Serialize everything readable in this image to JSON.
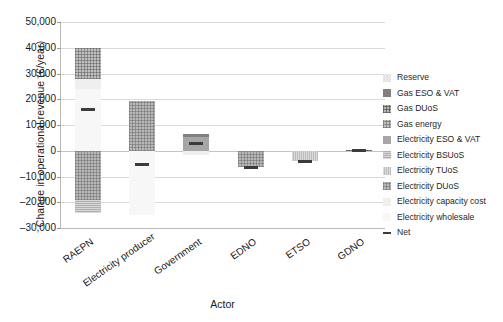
{
  "chart_data": {
    "type": "bar",
    "subtype": "stacked-bar-with-net-marker",
    "title": "",
    "xlabel": "Actor",
    "ylabel": "Change in operational revenue (€/year)",
    "ylim": [
      -30000,
      50000
    ],
    "ytick_step": 10000,
    "yticks": [
      50000,
      40000,
      30000,
      20000,
      10000,
      0,
      -10000,
      -20000,
      -30000
    ],
    "ytick_labels": [
      "50,000",
      "40,000",
      "30,000",
      "20,000",
      "10,000",
      "0",
      "–10,000",
      "–20,000",
      "–30,000"
    ],
    "grid": true,
    "legend_position": "right",
    "categories": [
      "RAEPN",
      "Electricity producer",
      "Government",
      "EDNO",
      "ETSO",
      "GDNO"
    ],
    "series": [
      {
        "name": "Reserve",
        "key": "reserve",
        "values": [
          0,
          0,
          0,
          0,
          0,
          0
        ]
      },
      {
        "name": "Gas ESO & VAT",
        "key": "gasesovat",
        "values": [
          0,
          0,
          1200,
          0,
          0,
          0
        ]
      },
      {
        "name": "Gas DUoS",
        "key": "gasduos",
        "values": [
          0,
          0,
          0,
          0,
          0,
          300
        ]
      },
      {
        "name": "Gas energy",
        "key": "gasenergy",
        "values": [
          12000,
          0,
          0,
          0,
          0,
          0
        ]
      },
      {
        "name": "Electricity ESO & VAT",
        "key": "elecesovat",
        "values": [
          0,
          0,
          5300,
          0,
          0,
          0
        ]
      },
      {
        "name": "Electricity BSUoS",
        "key": "elecbsuos",
        "values": [
          -5200,
          0,
          0,
          0,
          0,
          0
        ]
      },
      {
        "name": "Electricity TUoS",
        "key": "electuos",
        "values": [
          0,
          0,
          0,
          0,
          -4000,
          0
        ]
      },
      {
        "name": "Electricity DUoS",
        "key": "elecduos",
        "values": [
          -19000,
          19500,
          0,
          -6500,
          0,
          0
        ]
      },
      {
        "name": "Electricity capacity cost",
        "key": "eleccap",
        "values": [
          4000,
          0,
          -1500,
          0,
          0,
          0
        ]
      },
      {
        "name": "Electricity wholesale",
        "key": "elecwhole",
        "values": [
          24000,
          -25000,
          0,
          0,
          0,
          0
        ]
      }
    ],
    "net": {
      "name": "Net",
      "values": [
        16000,
        -5500,
        3000,
        -6500,
        -4000,
        0
      ]
    },
    "bar_stacks": {
      "RAEPN": {
        "positive": [
          {
            "series": "Gas energy",
            "from": 28000,
            "to": 40000
          },
          {
            "series": "Electricity capacity cost",
            "from": 24000,
            "to": 28000
          },
          {
            "series": "Electricity wholesale",
            "from": 0,
            "to": 24000
          }
        ],
        "negative": [
          {
            "series": "Electricity DUoS",
            "from": 0,
            "to": -19000
          },
          {
            "series": "Electricity BSUoS",
            "from": -19000,
            "to": -24200
          }
        ],
        "net": 16000
      },
      "Electricity producer": {
        "positive": [
          {
            "series": "Electricity DUoS",
            "from": 0,
            "to": 19500
          }
        ],
        "negative": [
          {
            "series": "Electricity wholesale",
            "from": 0,
            "to": -25000
          }
        ],
        "net": -5500
      },
      "Government": {
        "positive": [
          {
            "series": "Gas ESO & VAT",
            "from": 5300,
            "to": 6500
          },
          {
            "series": "Electricity ESO & VAT",
            "from": 0,
            "to": 5300
          }
        ],
        "negative": [
          {
            "series": "Electricity capacity cost",
            "from": 0,
            "to": -1500
          }
        ],
        "net": 3000
      },
      "EDNO": {
        "positive": [],
        "negative": [
          {
            "series": "Electricity DUoS",
            "from": 0,
            "to": -6500
          }
        ],
        "net": -6500
      },
      "ETSO": {
        "positive": [],
        "negative": [
          {
            "series": "Electricity TUoS",
            "from": 0,
            "to": -4000
          }
        ],
        "net": -4000
      },
      "GDNO": {
        "positive": [
          {
            "series": "Gas DUoS",
            "from": 0,
            "to": 400
          }
        ],
        "negative": [],
        "net": 0
      }
    }
  },
  "axes": {
    "y_title": "Change in operational revenue (€/year)",
    "x_title": "Actor",
    "ytick_labels": [
      "50,000",
      "40,000",
      "30,000",
      "20,000",
      "10,000",
      "0",
      "–10,000",
      "–20,000",
      "–30,000"
    ],
    "xtick_labels": [
      "RAEPN",
      "Electricity producer",
      "Government",
      "EDNO",
      "ETSO",
      "GDNO"
    ]
  },
  "legend": {
    "items": [
      {
        "label": "Reserve",
        "key": "reserve",
        "type": "swatch"
      },
      {
        "label": "Gas ESO & VAT",
        "key": "gasesovat",
        "type": "swatch"
      },
      {
        "label": "Gas DUoS",
        "key": "gasduos",
        "type": "swatch"
      },
      {
        "label": "Gas energy",
        "key": "gasenergy",
        "type": "swatch"
      },
      {
        "label": "Electricity ESO & VAT",
        "key": "elecesovat",
        "type": "swatch"
      },
      {
        "label": "Electricity BSUoS",
        "key": "elecbsuos",
        "type": "swatch"
      },
      {
        "label": "Electricity TUoS",
        "key": "electuos",
        "type": "swatch"
      },
      {
        "label": "Electricity DUoS",
        "key": "elecduos",
        "type": "swatch"
      },
      {
        "label": "Electricity capacity cost",
        "key": "eleccap",
        "type": "swatch"
      },
      {
        "label": "Electricity wholesale",
        "key": "elecwhole",
        "type": "swatch"
      },
      {
        "label": "Net",
        "key": "net",
        "type": "line"
      }
    ]
  },
  "colors": {
    "grid": "#d9d9d9",
    "axis": "#b9b9b9",
    "net": "#3b3b3b",
    "text": "#1a1a1a",
    "background": "#ffffff"
  }
}
